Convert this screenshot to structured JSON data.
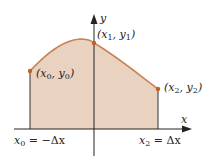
{
  "diagram": {
    "type": "area-under-curve",
    "colors": {
      "fill": "#e9d3c0",
      "curve": "#c8825a",
      "point": "#c0602c",
      "axis": "#222222",
      "boundary": "#333333"
    },
    "axes": {
      "x_label": "x",
      "y_label": "y"
    },
    "points": [
      {
        "name": "x0",
        "var": "x",
        "sub": "0",
        "yvar": "y",
        "ysub": "0",
        "label": "(x0, y0)"
      },
      {
        "name": "x1",
        "var": "x",
        "sub": "1",
        "yvar": "y",
        "ysub": "1",
        "label": "(x1, y1)"
      },
      {
        "name": "x2",
        "var": "x",
        "sub": "2",
        "yvar": "y",
        "ysub": "2",
        "label": "(x2, y2)"
      }
    ],
    "x_ticks": [
      {
        "left": "x",
        "sub": "0",
        "rest": " = −Δx",
        "label": "x0 = −Δx"
      },
      {
        "left": "x",
        "sub": "2",
        "rest": " = Δx",
        "label": "x2 = Δx"
      }
    ]
  }
}
